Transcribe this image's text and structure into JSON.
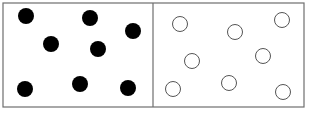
{
  "diagram": {
    "frame": {
      "x": 3,
      "y": 3,
      "width": 301,
      "height": 104,
      "stroke": "#6e6e6e"
    },
    "divider_x": 153,
    "left_panel": {
      "label": "filled-dots",
      "fill": "#000000",
      "radius": 8,
      "dots": [
        {
          "cx": 26,
          "cy": 16
        },
        {
          "cx": 90,
          "cy": 18
        },
        {
          "cx": 133,
          "cy": 31
        },
        {
          "cx": 51,
          "cy": 44
        },
        {
          "cx": 98,
          "cy": 49
        },
        {
          "cx": 25,
          "cy": 89
        },
        {
          "cx": 80,
          "cy": 84
        },
        {
          "cx": 128,
          "cy": 88
        }
      ]
    },
    "right_panel": {
      "label": "hollow-circles",
      "stroke": "#555555",
      "radius": 7.5,
      "dots": [
        {
          "cx": 180,
          "cy": 24
        },
        {
          "cx": 235,
          "cy": 32
        },
        {
          "cx": 282,
          "cy": 20
        },
        {
          "cx": 192,
          "cy": 61
        },
        {
          "cx": 263,
          "cy": 56
        },
        {
          "cx": 173,
          "cy": 89
        },
        {
          "cx": 229,
          "cy": 83
        },
        {
          "cx": 283,
          "cy": 92
        }
      ]
    }
  }
}
